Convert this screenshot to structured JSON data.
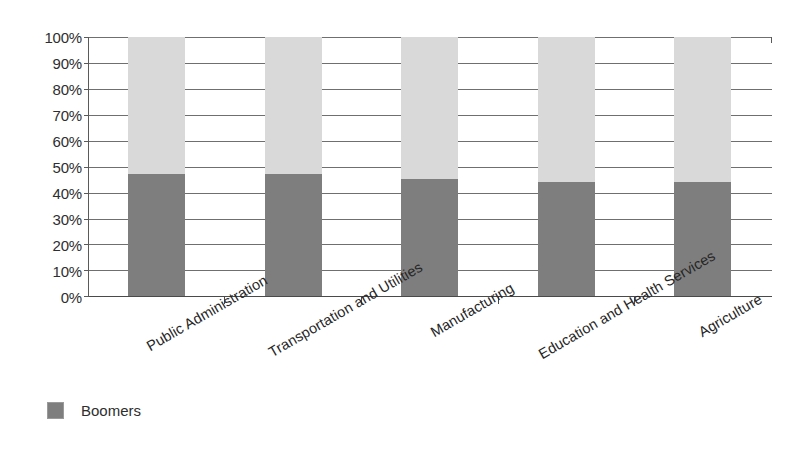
{
  "chart_data": {
    "type": "bar",
    "variant": "stacked-100-percent",
    "title": "",
    "xlabel": "",
    "ylabel": "",
    "ylim": [
      0,
      100
    ],
    "y_tick_labels": [
      "100%",
      "90%",
      "80%",
      "70%",
      "60%",
      "50%",
      "40%",
      "30%",
      "20%",
      "10%",
      "0%"
    ],
    "y_tick_values": [
      100,
      90,
      80,
      70,
      60,
      50,
      40,
      30,
      20,
      10,
      0
    ],
    "grid": true,
    "grid_axis": "y",
    "legend_position": "bottom-left",
    "categories": [
      "Public Administration",
      "Transportation and Utilities",
      "Manufacturing",
      "Education and Health Services",
      "Agriculture"
    ],
    "series": [
      {
        "name": "Boomers",
        "color": "#7e7e7e",
        "values": [
          47,
          47,
          45,
          44,
          44
        ],
        "in_legend": true
      },
      {
        "name": "Remainder",
        "color": "#d9d9d9",
        "values": [
          53,
          53,
          55,
          56,
          56
        ],
        "in_legend": false
      }
    ]
  },
  "legend": {
    "entries": [
      {
        "label": "Boomers",
        "color": "#7e7e7e"
      }
    ]
  },
  "colors": {
    "boomers": "#7e7e7e",
    "remainder": "#d9d9d9",
    "axis": "#4a4a4a",
    "gridline": "#6f6f6f",
    "text": "#2e2e2e",
    "background": "#ffffff"
  }
}
